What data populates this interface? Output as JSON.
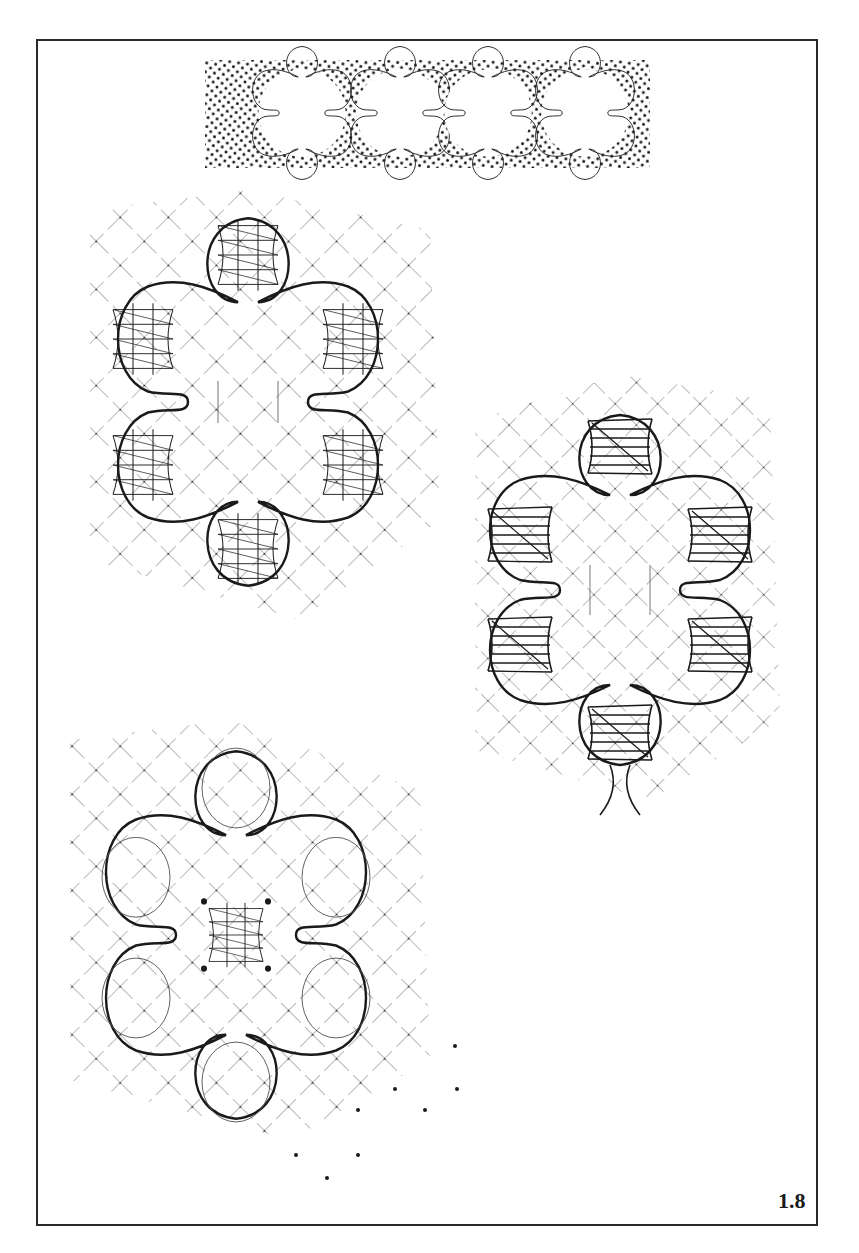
{
  "page": {
    "figure_label": "1.8"
  },
  "colors": {
    "ink": "#1a1a1a",
    "grid": "#555555",
    "paper": "#ffffff"
  },
  "header_strip": {
    "description": "Dotted ground strip with a row of four lace flower motifs",
    "motif_count": 4,
    "bounds": {
      "x": 205,
      "y": 60,
      "width": 445,
      "height": 108
    }
  },
  "diagrams": [
    {
      "id": "flower-cloth-stitch-petals",
      "description": "Six-petal flower; petals worked in cloth stitch over diagonal ground grid",
      "center": {
        "x": 248,
        "y": 402
      },
      "petals": 6
    },
    {
      "id": "flower-tally-petals",
      "description": "Six-petal flower; each petal containing a tally/leaf block with diagonal marker",
      "center": {
        "x": 620,
        "y": 590
      },
      "petals": 6
    },
    {
      "id": "flower-cloth-stitch-center",
      "description": "Six-petal flower outlined in gimp; center worked in cloth stitch",
      "center": {
        "x": 236,
        "y": 935
      },
      "petals": 6
    }
  ]
}
